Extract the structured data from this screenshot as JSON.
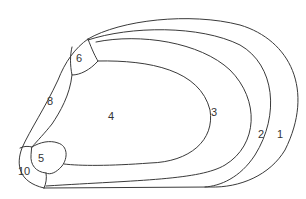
{
  "diagram": {
    "type": "nested-region-diagram",
    "stroke_color": "#3a3a3a",
    "background": "#ffffff",
    "regions": [
      {
        "id": "r1",
        "label": "1",
        "x": 281,
        "y": 134
      },
      {
        "id": "r2",
        "label": "2",
        "x": 262,
        "y": 134
      },
      {
        "id": "r3",
        "label": "3",
        "x": 215,
        "y": 112
      },
      {
        "id": "r4",
        "label": "4",
        "x": 112,
        "y": 120
      },
      {
        "id": "r5",
        "label": "5",
        "x": 42,
        "y": 162
      },
      {
        "id": "r6",
        "label": "6",
        "x": 79,
        "y": 62
      },
      {
        "id": "r8",
        "label": "8",
        "x": 51,
        "y": 105
      },
      {
        "id": "r10",
        "label": "10",
        "x": 24,
        "y": 175
      }
    ]
  }
}
